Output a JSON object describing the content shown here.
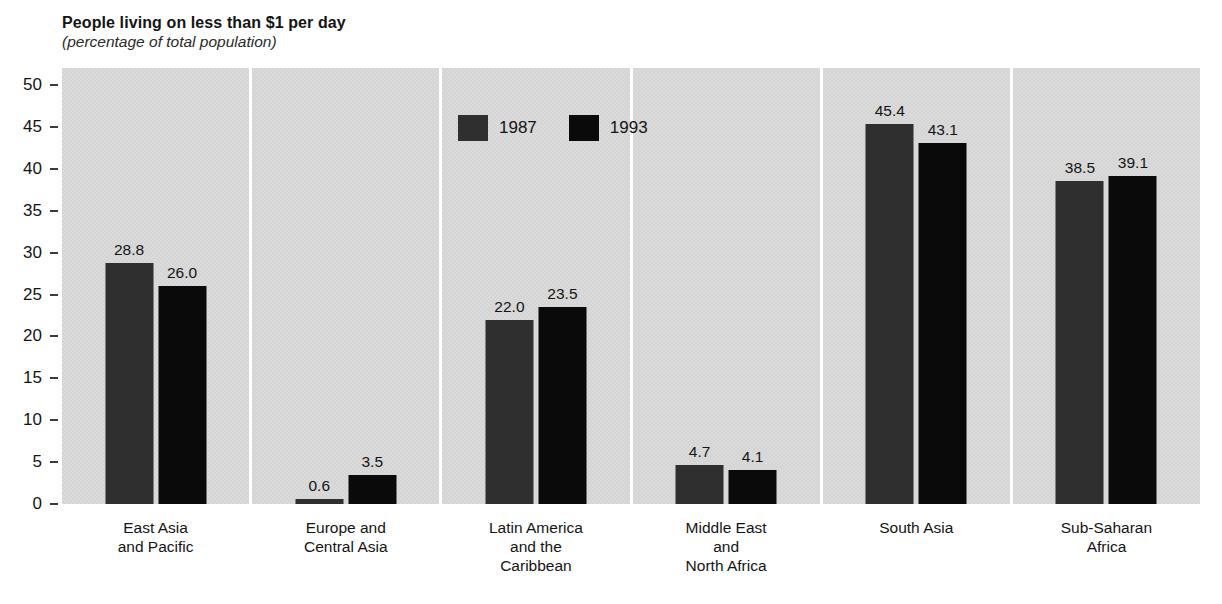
{
  "title": "People living on less than $1 per day",
  "subtitle": "(percentage of total population)",
  "colors": {
    "series_1987": "#2f2f2f",
    "series_1993": "#0a0a0a",
    "panel_background": "#d8d8d8",
    "page_background": "#ffffff",
    "text": "#141414"
  },
  "legend": {
    "items": [
      {
        "label": "1987",
        "color": "#2f2f2f"
      },
      {
        "label": "1993",
        "color": "#0a0a0a"
      }
    ]
  },
  "chart_data": {
    "type": "bar",
    "title": "People living on less than $1 per day",
    "subtitle": "(percentage of total population)",
    "categories": [
      [
        "East Asia",
        "and Pacific"
      ],
      [
        "Europe and",
        "Central Asia"
      ],
      [
        "Latin America",
        "and the",
        "Caribbean"
      ],
      [
        "Middle East",
        "and",
        "North Africa"
      ],
      [
        "South Asia"
      ],
      [
        "Sub-Saharan",
        "Africa"
      ]
    ],
    "series": [
      {
        "name": "1987",
        "color": "#2f2f2f",
        "values": [
          28.8,
          0.6,
          22.0,
          4.7,
          45.4,
          38.5
        ]
      },
      {
        "name": "1993",
        "color": "#0a0a0a",
        "values": [
          26.0,
          3.5,
          23.5,
          4.1,
          43.1,
          39.1
        ]
      }
    ],
    "ylabel": "",
    "xlabel": "",
    "ylim": [
      0,
      50
    ],
    "yticks": [
      0,
      5,
      10,
      15,
      20,
      25,
      30,
      35,
      40,
      45,
      50
    ],
    "grid": false,
    "value_labels": true,
    "value_label_format": "one-decimal",
    "legend_position": "inside-top, over third panel"
  }
}
